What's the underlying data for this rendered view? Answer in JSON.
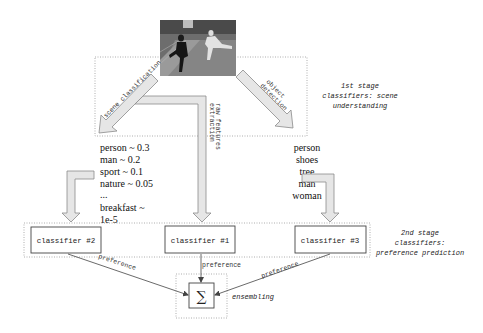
{
  "diagram": {
    "photo": {
      "description": "two people on a running track with trees in the background"
    },
    "stage1": {
      "note_line1": "1st stage",
      "note_line2": "classifiers: scene",
      "note_line3": "understanding",
      "arrows": {
        "scene": "scene classification",
        "raw_line1": "raw features",
        "raw_line2": "extraction",
        "object_line1": "object",
        "object_line2": "detection"
      }
    },
    "scene_outputs": [
      "person ~ 0.3",
      "man ~ 0.2",
      "sport ~ 0.1",
      "nature ~ 0.05",
      "...",
      "breakfast ~",
      "1e-5"
    ],
    "object_outputs": [
      "person",
      "shoes",
      "tree",
      "man",
      "woman"
    ],
    "stage2": {
      "note_line1": "2nd stage",
      "note_line2": "classifiers:",
      "note_line3": "preference prediction",
      "classifiers": [
        {
          "label": "classifier #2"
        },
        {
          "label": "classifier #1"
        },
        {
          "label": "classifier #3"
        }
      ],
      "edge_label_left": "preference",
      "edge_label_mid": "preference",
      "edge_label_right": "preference"
    },
    "ensemble": {
      "symbol": "∑",
      "label": "ensembling"
    }
  }
}
